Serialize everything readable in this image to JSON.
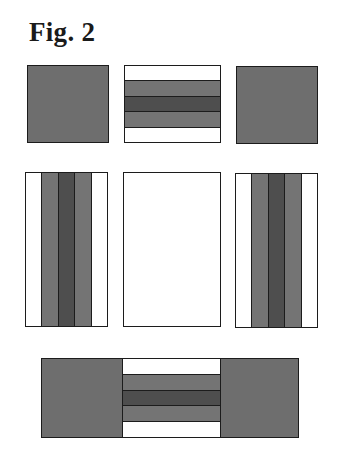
{
  "figure": {
    "title": "Fig. 2"
  },
  "colors": {
    "white": "#ffffff",
    "mid_gray": "#747474",
    "dark_gray": "#4e4e4e",
    "solid_gray": "#6e6e6e",
    "outline": "#1c1c1c"
  },
  "panels": {
    "top_row": [
      {
        "id": "top-left",
        "type": "solid-square",
        "fill": "solid_gray"
      },
      {
        "id": "top-center",
        "type": "horizontal-stripes",
        "bands": [
          "white",
          "mid_gray",
          "dark_gray",
          "mid_gray",
          "white"
        ]
      },
      {
        "id": "top-right",
        "type": "solid-square",
        "fill": "solid_gray"
      }
    ],
    "middle_row": [
      {
        "id": "middle-left",
        "type": "vertical-stripes",
        "bands": [
          "white",
          "mid_gray",
          "dark_gray",
          "mid_gray",
          "white"
        ]
      },
      {
        "id": "middle-center",
        "type": "blank-rectangle",
        "fill": "white"
      },
      {
        "id": "middle-right",
        "type": "vertical-stripes",
        "bands": [
          "white",
          "mid_gray",
          "dark_gray",
          "mid_gray",
          "white"
        ]
      }
    ],
    "bottom_row": [
      {
        "id": "bottom-combined",
        "type": "combined-strip",
        "left": "solid_gray",
        "center_bands": [
          "white",
          "mid_gray",
          "dark_gray",
          "mid_gray",
          "white"
        ],
        "right": "solid_gray"
      }
    ]
  }
}
